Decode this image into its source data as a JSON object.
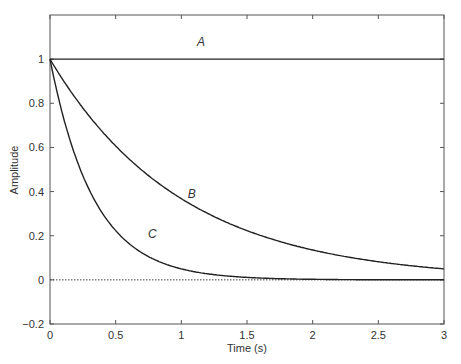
{
  "chart_data": {
    "type": "line",
    "title": "",
    "xlabel": "Time (s)",
    "ylabel": "Amplitude",
    "xlim": [
      0,
      3
    ],
    "ylim": [
      -0.2,
      1.2
    ],
    "grid": false,
    "legend": "none (inline curve labels)",
    "xticks": [
      0,
      0.5,
      1,
      1.5,
      2,
      2.5,
      3
    ],
    "xtick_labels": [
      "0",
      "0.5",
      "1",
      "1.5",
      "2",
      "2.5",
      "3"
    ],
    "yticks": [
      -0.2,
      0,
      0.2,
      0.4,
      0.6,
      0.8,
      1
    ],
    "ytick_labels": [
      "−0.2",
      "0",
      "0.2",
      "0.4",
      "0.6",
      "0.8",
      "1"
    ],
    "x": [
      0,
      0.25,
      0.5,
      0.75,
      1,
      1.25,
      1.5,
      1.75,
      2,
      2.25,
      2.5,
      2.75,
      3
    ],
    "series": [
      {
        "name": "A",
        "label_at": [
          1.15,
          1.06
        ],
        "values": [
          1,
          1,
          1,
          1,
          1,
          1,
          1,
          1,
          1,
          1,
          1,
          1,
          1
        ]
      },
      {
        "name": "B",
        "label_at": [
          1.08,
          0.37
        ],
        "values": [
          1,
          0.78,
          0.61,
          0.47,
          0.37,
          0.29,
          0.22,
          0.17,
          0.14,
          0.11,
          0.08,
          0.06,
          0.05
        ]
      },
      {
        "name": "C",
        "label_at": [
          0.78,
          0.19
        ],
        "values": [
          1,
          0.47,
          0.22,
          0.11,
          0.05,
          0.02,
          0.01,
          0.005,
          0.002,
          0.001,
          0.0,
          0.0,
          0.0
        ]
      }
    ],
    "reference_line": {
      "y": 0,
      "style": "dotted"
    }
  }
}
